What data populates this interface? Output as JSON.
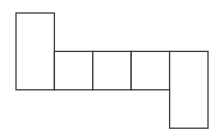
{
  "diagram": {
    "stroke_color": "#3a3a3a",
    "fill_color": "#ffffff",
    "faces": [
      {
        "name": "face-top-left",
        "grid_col": 0,
        "grid_row": 0,
        "span_rows": 2
      },
      {
        "name": "face-middle-1",
        "grid_col": 1,
        "grid_row": 1,
        "span_rows": 1
      },
      {
        "name": "face-middle-2",
        "grid_col": 2,
        "grid_row": 1,
        "span_rows": 1
      },
      {
        "name": "face-middle-3",
        "grid_col": 3,
        "grid_row": 1,
        "span_rows": 1
      },
      {
        "name": "face-bottom-right",
        "grid_col": 4,
        "grid_row": 1,
        "span_rows": 2
      }
    ]
  }
}
